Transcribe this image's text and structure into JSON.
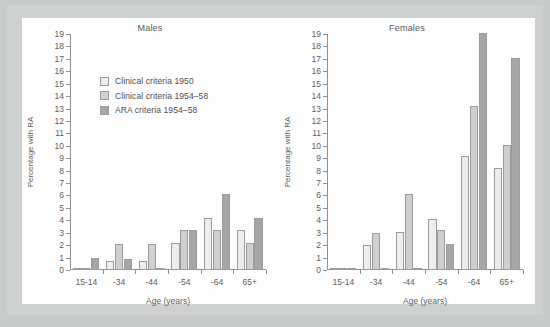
{
  "chart_data": {
    "type": "bar",
    "title": "",
    "panels": [
      {
        "title": "Males",
        "xlabel": "Age (years)",
        "ylabel": "Percentage with RA",
        "ylim": [
          0,
          19
        ],
        "categories": [
          "15-14",
          "-34",
          "-44",
          "-54",
          "-64",
          "65+"
        ],
        "series": [
          {
            "name": "Clinical criteria 1950",
            "values": [
              0.2,
              0.7,
              0.7,
              2.2,
              4.2,
              3.2
            ]
          },
          {
            "name": "Clinical criteria 1954–58",
            "values": [
              0.2,
              2.1,
              2.1,
              3.2,
              3.2,
              2.2
            ]
          },
          {
            "name": "ARA criteria 1954–58",
            "values": [
              1.0,
              0.9,
              0.2,
              3.2,
              6.1,
              4.2
            ]
          }
        ]
      },
      {
        "title": "Females",
        "xlabel": "Age (years)",
        "ylabel": "Percentage with RA",
        "ylim": [
          0,
          19
        ],
        "categories": [
          "15-14",
          "-34",
          "-44",
          "-54",
          "-64",
          "65+"
        ],
        "series": [
          {
            "name": "Clinical criteria 1950",
            "values": [
              0.1,
              2.0,
              3.05,
              4.1,
              9.2,
              8.2
            ]
          },
          {
            "name": "Clinical criteria 1954–58",
            "values": [
              0.1,
              3.0,
              6.1,
              3.2,
              13.2,
              10.1
            ]
          },
          {
            "name": "ARA criteria 1954–58",
            "values": [
              0.15,
              0.15,
              0.15,
              2.1,
              19.1,
              17.1
            ]
          }
        ]
      }
    ],
    "yticks": [
      0,
      1,
      2,
      3,
      4,
      5,
      6,
      7,
      8,
      9,
      10,
      11,
      12,
      13,
      14,
      15,
      16,
      17,
      18,
      19
    ],
    "grid": false,
    "legend": {
      "position": "upper-left-of-males-panel",
      "entries": [
        {
          "label": "Clinical criteria 1950",
          "color": "#eceded"
        },
        {
          "label": "Clinical criteria 1954–58",
          "color": "#cdcfd0"
        },
        {
          "label": "ARA criteria 1954–58",
          "color": "#a4a6a8"
        }
      ]
    },
    "colors": {
      "series_1": "#eceded",
      "series_2": "#cdcfd0",
      "series_3": "#a4a6a8",
      "axis": "#8e9092",
      "text": "#5d5f61",
      "plot_background": "#fdfdfd",
      "frame": "#cfd1d1",
      "page_background": "#c9cbcb"
    }
  }
}
